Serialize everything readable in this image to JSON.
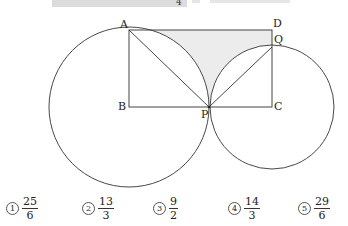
{
  "top_strip": {
    "cut_denominator": "4"
  },
  "figure": {
    "points": {
      "A": {
        "label": "A",
        "x": 129,
        "y": 30
      },
      "D": {
        "label": "D",
        "x": 272,
        "y": 30
      },
      "Q": {
        "label": "Q",
        "x": 272,
        "y": 47
      },
      "B": {
        "label": "B",
        "x": 129,
        "y": 107
      },
      "C": {
        "label": "C",
        "x": 272,
        "y": 107
      },
      "P": {
        "label": "P",
        "x": 209,
        "y": 107
      }
    },
    "shade_color": "#ececec",
    "line_color": "#333333"
  },
  "choices": [
    {
      "marker": "1",
      "numerator": "25",
      "denominator": "6"
    },
    {
      "marker": "2",
      "numerator": "13",
      "denominator": "3"
    },
    {
      "marker": "3",
      "numerator": "9",
      "denominator": "2"
    },
    {
      "marker": "4",
      "numerator": "14",
      "denominator": "3"
    },
    {
      "marker": "5",
      "numerator": "29",
      "denominator": "6"
    }
  ]
}
